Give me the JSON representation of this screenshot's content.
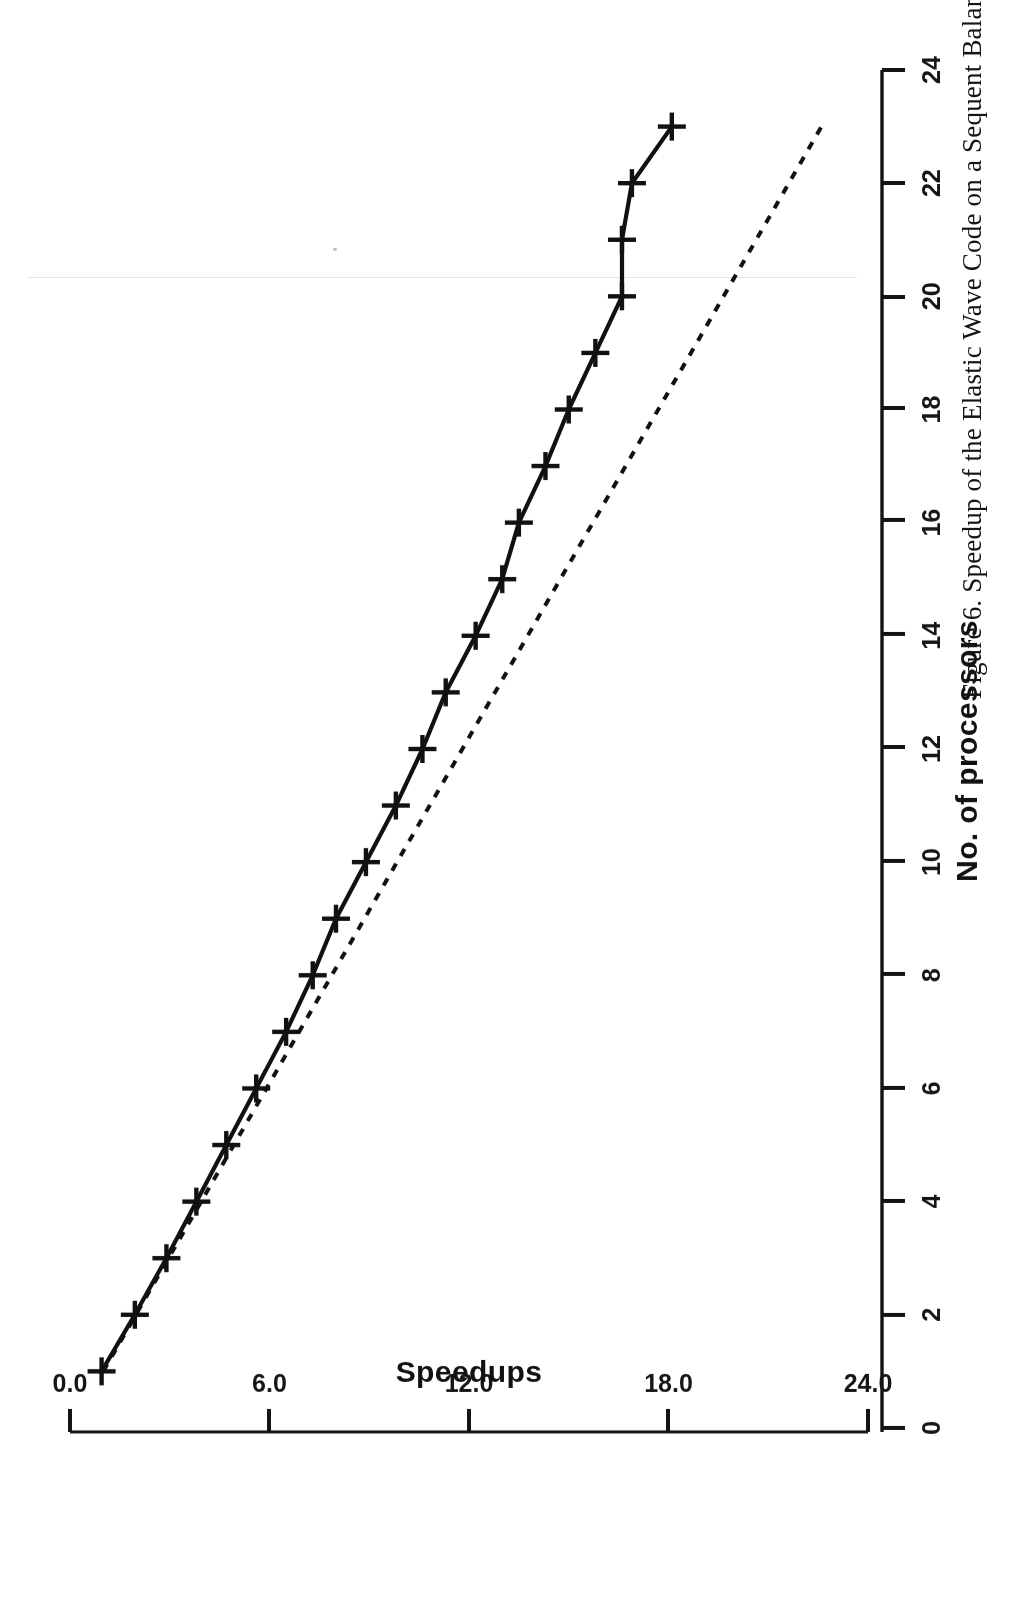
{
  "figure": {
    "caption": "Figure 6.  Speedup of the Elastic Wave Code on a Sequent Balance 21000.",
    "caption_number": "Figure 6.",
    "orientation_note": "page scanned upside down (180 degrees)"
  },
  "chart_data": {
    "type": "line",
    "title": "",
    "xlabel": "No. of processors",
    "ylabel": "Speedups",
    "xlim": [
      0,
      24
    ],
    "ylim": [
      0.0,
      24.0
    ],
    "xticks": [
      0,
      2,
      4,
      6,
      8,
      10,
      12,
      14,
      16,
      18,
      20,
      22,
      24
    ],
    "xtick_labels": [
      "0",
      "2",
      "4",
      "6",
      "8",
      "10",
      "12",
      "14",
      "16",
      "18",
      "20",
      "22",
      "24"
    ],
    "yticks": [
      0.0,
      6.0,
      12.0,
      18.0,
      24.0
    ],
    "ytick_labels": [
      "0.0",
      "6.0",
      "12.0",
      "18.0",
      "24.0"
    ],
    "grid": false,
    "legend": null,
    "series": [
      {
        "name": "Measured speedup",
        "style": "solid-with-plus-markers",
        "marker": "plus",
        "color": "#111111",
        "x": [
          1,
          2,
          3,
          4,
          5,
          6,
          7,
          8,
          9,
          10,
          11,
          12,
          13,
          14,
          15,
          16,
          17,
          18,
          19,
          20,
          21,
          22,
          23
        ],
        "y": [
          0.95,
          1.95,
          2.9,
          3.8,
          4.7,
          5.6,
          6.5,
          7.3,
          8.0,
          8.9,
          9.8,
          10.6,
          11.3,
          12.2,
          13.0,
          13.5,
          14.3,
          15.0,
          15.8,
          16.6,
          16.6,
          16.9,
          18.1
        ]
      },
      {
        "name": "Ideal linear speedup",
        "style": "dashed",
        "marker": "none",
        "color": "#111111",
        "x": [
          1,
          23
        ],
        "y": [
          1.0,
          22.6
        ]
      }
    ]
  }
}
